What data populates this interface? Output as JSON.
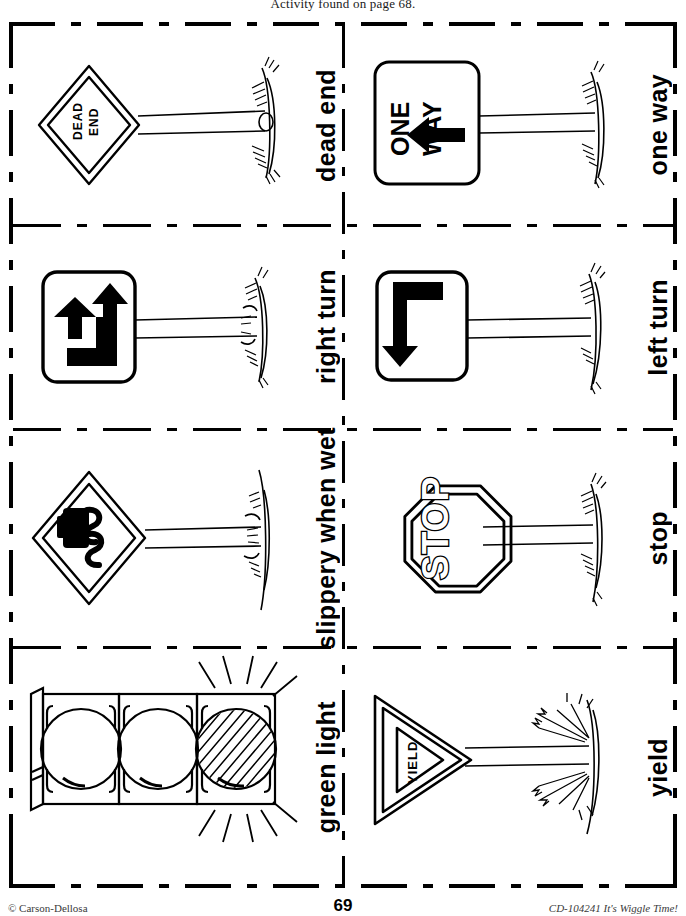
{
  "page": {
    "header_note": "Activity found on page 68.",
    "page_number": "69",
    "footer_left": "© Carson-Dellosa",
    "footer_right": "CD-104241 It's Wiggle Time!"
  },
  "cards": [
    {
      "label": "dead end",
      "sign_type": "diamond",
      "sign_text": "DEAD END"
    },
    {
      "label": "one way",
      "sign_type": "one-way",
      "sign_text": "ONE WAY"
    },
    {
      "label": "right turn",
      "sign_type": "right-turn",
      "sign_text": ""
    },
    {
      "label": "left turn",
      "sign_type": "left-turn",
      "sign_text": ""
    },
    {
      "label": "slippery when wet",
      "sign_type": "slippery",
      "sign_text": ""
    },
    {
      "label": "stop",
      "sign_type": "octagon",
      "sign_text": "STOP"
    },
    {
      "label": "green light",
      "sign_type": "traffic-light",
      "sign_text": ""
    },
    {
      "label": "yield",
      "sign_type": "triangle",
      "sign_text": "YIELD"
    }
  ],
  "colors": {
    "ink": "#000000",
    "paper": "#ffffff"
  }
}
